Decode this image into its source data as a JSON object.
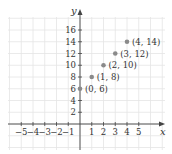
{
  "chart_data": {
    "type": "scatter",
    "title": "",
    "xlabel": "x",
    "ylabel": "y",
    "xlim": [
      -6,
      7
    ],
    "ylim": [
      -4,
      18
    ],
    "grid": true,
    "x_ticks": [
      -5,
      -4,
      -3,
      -2,
      -1,
      1,
      2,
      3,
      4,
      5
    ],
    "x_tick_labels": [
      "−5",
      "−4",
      "−3",
      "−2",
      "−1",
      "1",
      "2",
      "3",
      "4",
      "5"
    ],
    "y_ticks": [
      2,
      4,
      6,
      8,
      10,
      12,
      14,
      16
    ],
    "y_tick_labels": [
      "2",
      "4",
      "6",
      "8",
      "10",
      "12",
      "14",
      "16"
    ],
    "points": [
      {
        "x": 0,
        "y": 6,
        "label": "(0, 6)"
      },
      {
        "x": 1,
        "y": 8,
        "label": "(1, 8)"
      },
      {
        "x": 2,
        "y": 10,
        "label": "(2, 10)"
      },
      {
        "x": 3,
        "y": 12,
        "label": "(3, 12)"
      },
      {
        "x": 4,
        "y": 14,
        "label": "(4, 14)"
      }
    ],
    "colors": {
      "point": "#8a8a8a",
      "axis": "#444444",
      "grid": "#e4e4e4"
    }
  }
}
